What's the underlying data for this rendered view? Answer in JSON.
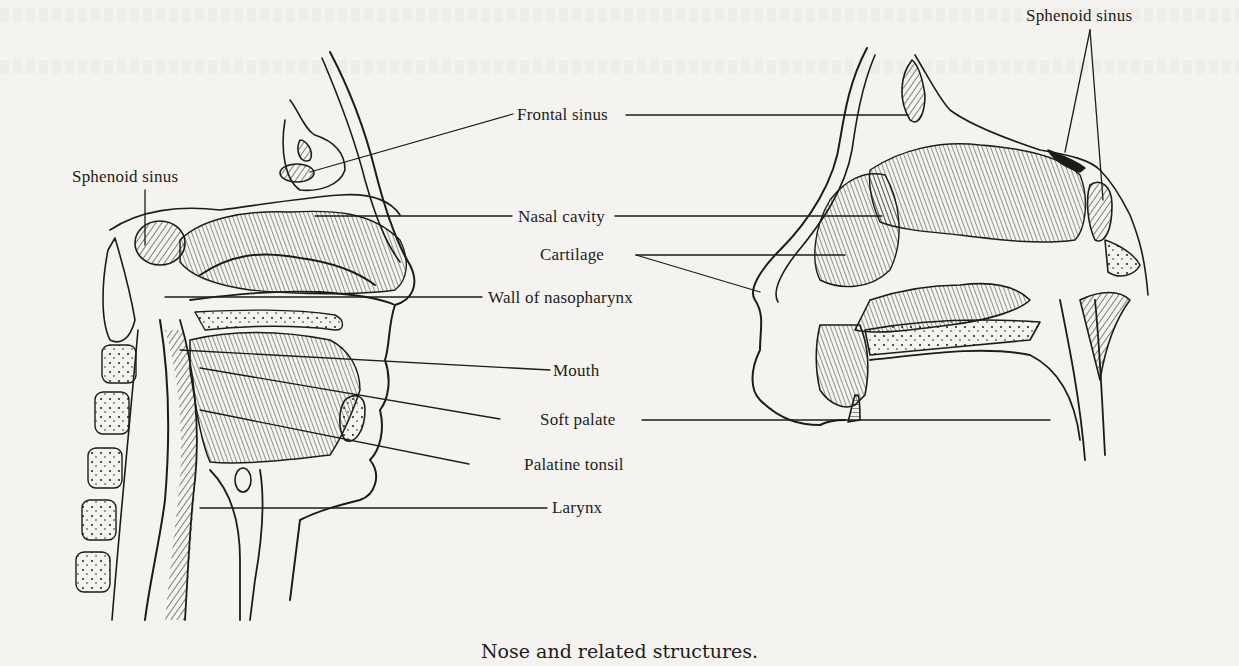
{
  "figure": {
    "caption": "Nose and related structures.",
    "colors": {
      "ink": "#1e1c1a",
      "paper": "#f4f3f0"
    },
    "panels": [
      {
        "id": "left",
        "description": "Sagittal section of head showing nasal cavity, mouth and throat"
      },
      {
        "id": "right",
        "description": "Sagittal section of nose showing nasal cavity and sinuses"
      }
    ],
    "labels": {
      "frontal_sinus": "Frontal sinus",
      "sphenoid_sinus_left": "Sphenoid sinus",
      "sphenoid_sinus_right": "Sphenoid sinus",
      "nasal_cavity": "Nasal cavity",
      "cartilage": "Cartilage",
      "wall_of_nasopharynx": "Wall of nasopharynx",
      "mouth": "Mouth",
      "soft_palate": "Soft palate",
      "palatine_tonsil": "Palatine tonsil",
      "larynx": "Larynx"
    }
  }
}
